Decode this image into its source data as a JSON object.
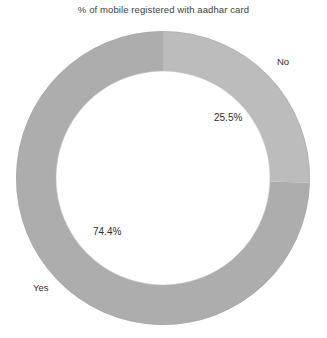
{
  "chart": {
    "title": "% of mobile registered with aadhar card"
  },
  "labels": {
    "no": "No",
    "yes": "Yes"
  },
  "values": {
    "no": "25.5%",
    "yes": "74.4%"
  },
  "colors": {
    "no_slice": "#bcbcbc",
    "yes_slice": "#adadad",
    "text": "#2e2e2e",
    "title_text": "#3d3d3d",
    "background": "#ffffff"
  },
  "chart_data": {
    "type": "pie",
    "variant": "donut",
    "title": "% of mobile registered with aadhar card",
    "categories": [
      "No",
      "Yes"
    ],
    "values": [
      25.5,
      74.4
    ],
    "value_labels": [
      "25.5%",
      "74.4%"
    ],
    "colors": [
      "#bcbcbc",
      "#adadad"
    ],
    "unit": "%",
    "start_angle_deg": 0,
    "direction": "clockwise",
    "inner_radius_ratio": 0.73,
    "legend": "none",
    "grid": false,
    "data_labels_shown": true,
    "series": [
      {
        "name": "No",
        "value": 25.5,
        "label": "25.5%",
        "color": "#bcbcbc"
      },
      {
        "name": "Yes",
        "value": 74.4,
        "label": "74.4%",
        "color": "#adadad"
      }
    ]
  }
}
